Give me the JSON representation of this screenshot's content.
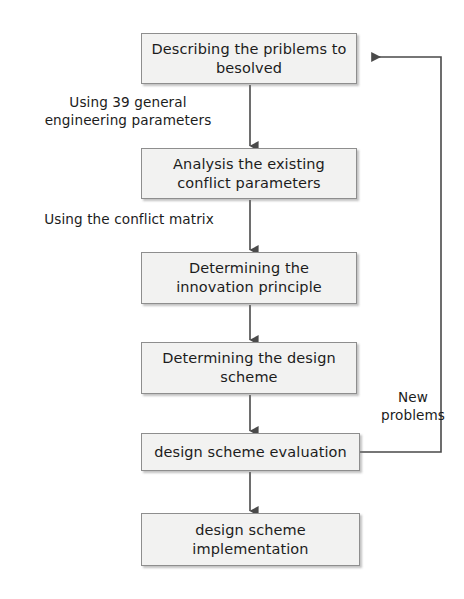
{
  "diagram": {
    "type": "flowchart",
    "orientation": "top-to-bottom",
    "colors": {
      "node_fill": "#f2f2f1",
      "node_border": "#8e8e8e",
      "connector": "#4a4a4a",
      "text": "#1c1c1c",
      "background": "#ffffff"
    },
    "nodes": [
      {
        "id": "describe",
        "label": "Describing the priblems to\nbesolved",
        "x": 141,
        "y": 33,
        "w": 216,
        "h": 51
      },
      {
        "id": "analysis",
        "label": "Analysis the existing\nconflict parameters",
        "x": 141,
        "y": 148,
        "w": 216,
        "h": 51
      },
      {
        "id": "principle",
        "label": "Determining the\ninnovation principle",
        "x": 141,
        "y": 252,
        "w": 216,
        "h": 52
      },
      {
        "id": "scheme",
        "label": "Determining the design\nscheme",
        "x": 141,
        "y": 342,
        "w": 216,
        "h": 52
      },
      {
        "id": "evaluation",
        "label": "design scheme evaluation",
        "x": 141,
        "y": 433,
        "w": 219,
        "h": 38
      },
      {
        "id": "implementation",
        "label": "design scheme\nimplementation",
        "x": 141,
        "y": 513,
        "w": 219,
        "h": 53
      }
    ],
    "edge_labels": [
      {
        "id": "label-39-params",
        "text": "Using 39 general\nengineering parameters",
        "x": 24,
        "y": 94,
        "w": 208
      },
      {
        "id": "label-conflict-matrix",
        "text": "Using the conflict matrix",
        "x": 26,
        "y": 211,
        "w": 206
      },
      {
        "id": "label-new-problems",
        "text": "New\nproblems",
        "x": 370,
        "y": 389,
        "w": 86
      }
    ],
    "connectors": [
      {
        "id": "describe-to-analysis",
        "from": "describe",
        "to": "analysis",
        "kind": "arrow-down"
      },
      {
        "id": "analysis-to-principle",
        "from": "analysis",
        "to": "principle",
        "kind": "arrow-down"
      },
      {
        "id": "principle-to-scheme",
        "from": "principle",
        "to": "scheme",
        "kind": "arrow-down"
      },
      {
        "id": "scheme-to-evaluation",
        "from": "scheme",
        "to": "evaluation",
        "kind": "arrow-down"
      },
      {
        "id": "evaluation-to-implementation",
        "from": "evaluation",
        "to": "implementation",
        "kind": "arrow-down"
      },
      {
        "id": "evaluation-feedback-to-describe",
        "from": "evaluation",
        "to": "describe",
        "kind": "feedback-loop-right"
      }
    ]
  }
}
